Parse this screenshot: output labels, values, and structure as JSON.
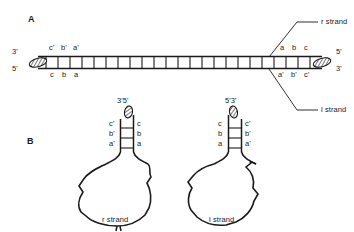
{
  "figure": {
    "panels": [
      {
        "id": "A",
        "letter": "A",
        "type": "linear-duplex",
        "left_end": {
          "top_label": "3'",
          "bottom_label": "5'"
        },
        "right_end": {
          "top_label": "5'",
          "bottom_label": "3'"
        },
        "left_top_seq": [
          "c'",
          "b'",
          "a'"
        ],
        "left_bottom_seq": [
          "c",
          "b",
          "a"
        ],
        "right_top_seq": [
          "a",
          "b",
          "c"
        ],
        "right_bottom_seq": [
          "a'",
          "b'",
          "c'"
        ],
        "rungs": 23,
        "callouts": [
          {
            "name": "r-strand",
            "label": "r strand",
            "points_to": "top-strand"
          },
          {
            "name": "l-strand",
            "label": "l strand",
            "points_to": "bottom-strand"
          }
        ]
      },
      {
        "id": "B",
        "letter": "B",
        "type": "hairpin-loops",
        "structures": [
          {
            "name": "r-strand-structure",
            "caption": "r strand",
            "end_label": "3'5'",
            "stem_left_seq": [
              "c'",
              "b'",
              "a'"
            ],
            "stem_right_seq": [
              "c",
              "b",
              "a"
            ],
            "base_pairs": 3
          },
          {
            "name": "l-strand-structure",
            "caption": "l strand",
            "end_label": "5'3'",
            "stem_left_seq": [
              "c",
              "b",
              "a"
            ],
            "stem_right_seq": [
              "c'",
              "b'",
              "a'"
            ],
            "base_pairs": 3
          }
        ]
      }
    ]
  },
  "colors": {
    "background": "#ffffff",
    "stroke": "#1a1a1a",
    "text": "#1a1a1a",
    "cap_fill": "#8c8c8c"
  }
}
